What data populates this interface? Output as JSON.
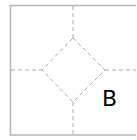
{
  "diagram": {
    "label": "B",
    "colors": {
      "frame": "#b5b5b5",
      "dashed": "#a8a8a8",
      "label": "#000000",
      "background": "#ffffff"
    }
  }
}
